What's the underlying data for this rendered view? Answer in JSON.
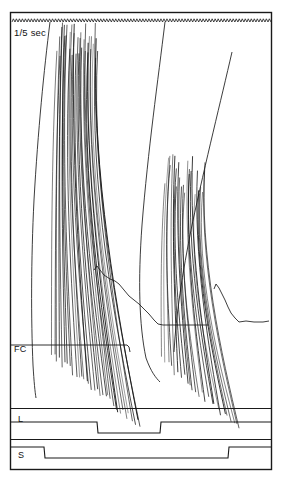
{
  "figure": {
    "background_color": "#ffffff",
    "ink_color": "#1a1a1a",
    "frame": {
      "x": 10,
      "y": 12,
      "width": 262,
      "height": 458
    }
  },
  "labels": {
    "timebase": "1/5 sec",
    "fc": "FC",
    "l": "L",
    "s": "S"
  },
  "chart_data": {
    "type": "line",
    "subtitle": "",
    "xlabel": "",
    "ylabel": "",
    "grid": false,
    "legend_position": "none",
    "xlim": [
      10,
      272
    ],
    "ylim": [
      12,
      470
    ],
    "axis_note": "Coordinates are in screenshot pixel space; y increases downward.",
    "panels": [
      {
        "name": "main-trace-panel",
        "label": "",
        "y_range": [
          12,
          430
        ],
        "description": "Dense fanned bundles of near-vertical oscillograph sweeps plus slow baseline traces"
      },
      {
        "name": "fc-panel",
        "label": "FC",
        "baseline_y": 345,
        "baseline_x_start": 11,
        "baseline_x_end": 130,
        "description": "FC reference baseline at left"
      },
      {
        "name": "l-channel-panel",
        "label": "L",
        "y_range": [
          408,
          440
        ],
        "description": "Step marker channel L"
      },
      {
        "name": "s-channel-panel",
        "label": "S",
        "y_range": [
          440,
          470
        ],
        "description": "Step marker channel S"
      }
    ],
    "timebase": {
      "label": "1/5 sec",
      "trace_y": 22,
      "x_start": 12,
      "x_end": 271,
      "tick_count": 86,
      "amplitude": 3.2,
      "description": "Fine sawtooth time-marker trace spanning the full width"
    },
    "series": [
      {
        "name": "timing-marker",
        "type": "sawtooth",
        "y": 22,
        "x": [
          12,
          271
        ],
        "values": [
          22,
          22
        ]
      },
      {
        "name": "fc-baseline",
        "type": "step",
        "x": [
          11,
          127,
          130
        ],
        "values": [
          345,
          345,
          352
        ]
      },
      {
        "name": "l-channel-step",
        "type": "step",
        "x": [
          11,
          97,
          97,
          160,
          160,
          271
        ],
        "values": [
          422,
          422,
          433,
          433,
          422,
          422
        ]
      },
      {
        "name": "s-channel-step",
        "type": "step",
        "x": [
          11,
          44,
          44,
          228,
          228,
          271
        ],
        "values": [
          447,
          447,
          458,
          458,
          447,
          447
        ]
      },
      {
        "name": "slow-baseline-1",
        "type": "line",
        "x": [
          94,
          98,
          103,
          110,
          118,
          124,
          131,
          139,
          146,
          152,
          157,
          162,
          173,
          190,
          207
        ],
        "values": [
          270,
          267,
          274,
          279,
          283,
          290,
          297,
          303,
          309,
          316,
          322,
          325,
          325,
          325,
          325
        ]
      },
      {
        "name": "slow-baseline-2",
        "type": "line",
        "x": [
          214,
          217,
          222,
          226,
          230,
          235,
          240,
          248,
          258,
          268
        ],
        "values": [
          288,
          285,
          293,
          300,
          309,
          317,
          322,
          321,
          323,
          322
        ]
      },
      {
        "name": "long-sweep-left",
        "type": "curve",
        "x": [
          50,
          46,
          42,
          38,
          35,
          33,
          32,
          32,
          33,
          36
        ],
        "values": [
          22,
          70,
          120,
          175,
          230,
          280,
          320,
          355,
          380,
          398
        ]
      },
      {
        "name": "long-sweep-mid",
        "type": "curve",
        "x": [
          165,
          160,
          152,
          146,
          142,
          140,
          141,
          145,
          152,
          160
        ],
        "values": [
          22,
          70,
          130,
          190,
          245,
          295,
          330,
          355,
          372,
          382
        ]
      },
      {
        "name": "long-sweep-right",
        "type": "curve",
        "x": [
          232,
          224,
          214,
          204,
          194,
          186,
          180,
          176,
          174
        ],
        "values": [
          52,
          90,
          135,
          180,
          225,
          265,
          300,
          330,
          352
        ]
      }
    ],
    "bundles": [
      {
        "name": "bundle-1",
        "x_top_range": [
          58,
          98
        ],
        "y_top_range": [
          22,
          60
        ],
        "x_bottom_range": [
          52,
          140
        ],
        "y_bottom_range": [
          355,
          425
        ],
        "stroke_count": 34,
        "description": "First dense fan of oscillograph sweeps, left of centre"
      },
      {
        "name": "bundle-2",
        "x_top_range": [
          166,
          206
        ],
        "y_top_range": [
          150,
          200
        ],
        "x_bottom_range": [
          162,
          240
        ],
        "y_bottom_range": [
          360,
          428
        ],
        "stroke_count": 26,
        "description": "Second dense fan of oscillograph sweeps, right of centre"
      }
    ]
  }
}
